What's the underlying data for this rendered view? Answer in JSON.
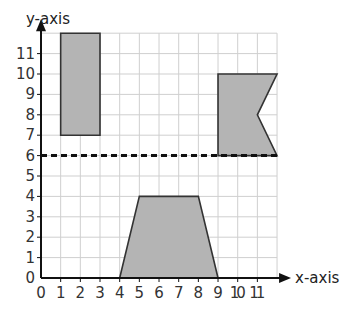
{
  "chart_data": {
    "type": "coordinate-grid",
    "xlabel": "x-axis",
    "ylabel": "y-axis",
    "xlim": [
      0,
      12
    ],
    "ylim": [
      0,
      12
    ],
    "x_ticks": [
      "0",
      "1",
      "2",
      "3",
      "4",
      "5",
      "6",
      "7",
      "8",
      "9",
      "10",
      "11"
    ],
    "y_ticks": [
      "0",
      "1",
      "2",
      "3",
      "4",
      "5",
      "6",
      "7",
      "8",
      "9",
      "10",
      "11"
    ],
    "grid": true,
    "dashed_line": {
      "y": 6,
      "from_x": 0,
      "to_x": 12
    },
    "shapes": [
      {
        "name": "rectangle",
        "points": [
          [
            1,
            7
          ],
          [
            3,
            7
          ],
          [
            3,
            12
          ],
          [
            1,
            12
          ]
        ]
      },
      {
        "name": "flag",
        "points": [
          [
            9,
            6
          ],
          [
            9,
            10
          ],
          [
            12,
            10
          ],
          [
            11,
            8
          ],
          [
            12,
            6
          ]
        ]
      },
      {
        "name": "trapezoid",
        "points": [
          [
            4,
            0
          ],
          [
            5,
            4
          ],
          [
            8,
            4
          ],
          [
            9,
            0
          ]
        ]
      }
    ],
    "fill_color": "#b4b4b4",
    "stroke_color": "#333333"
  }
}
